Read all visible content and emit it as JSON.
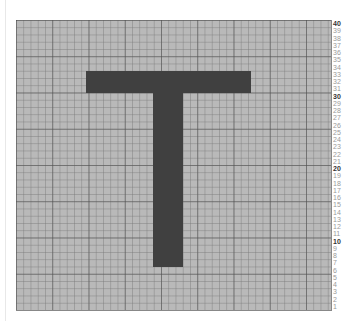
{
  "canvas": {
    "rows": 40,
    "cols": 43,
    "cell_color": "#b9b9b9",
    "fill_color": "#404040"
  },
  "shape": {
    "letter": "T",
    "bar": {
      "col_start": 10,
      "col_end": 32,
      "row_top": 33,
      "row_bottom": 31
    },
    "stem": {
      "col_start": 19,
      "col_end": 23,
      "row_top": 30,
      "row_bottom": 7
    }
  },
  "row_labels": [
    "40",
    "39",
    "38",
    "37",
    "36",
    "35",
    "34",
    "33",
    "32",
    "31",
    "30",
    "29",
    "28",
    "27",
    "26",
    "25",
    "24",
    "23",
    "22",
    "21",
    "20",
    "19",
    "18",
    "17",
    "16",
    "15",
    "14",
    "13",
    "12",
    "11",
    "10",
    "9",
    "8",
    "7",
    "6",
    "5",
    "4",
    "3",
    "2",
    "1"
  ],
  "major_labels": [
    "40",
    "30",
    "20",
    "10"
  ]
}
